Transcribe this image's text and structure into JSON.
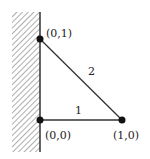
{
  "diagram": {
    "wall": {
      "x": 40,
      "y_top": 12,
      "y_bottom": 152,
      "hatch_left": 12
    },
    "nodes": [
      {
        "id": "n01",
        "label": "(0,1)",
        "x": 40,
        "y": 39
      },
      {
        "id": "n00",
        "label": "(0,0)",
        "x": 40,
        "y": 120
      },
      {
        "id": "n10",
        "label": "(1,0)",
        "x": 122,
        "y": 120
      }
    ],
    "edges": [
      {
        "id": "e1",
        "from": "n00",
        "to": "n10",
        "label": "1"
      },
      {
        "id": "e2",
        "from": "n01",
        "to": "n10",
        "label": "2"
      }
    ],
    "colors": {
      "line": "#333333",
      "node": "#111111",
      "hatch": "#777777"
    }
  }
}
